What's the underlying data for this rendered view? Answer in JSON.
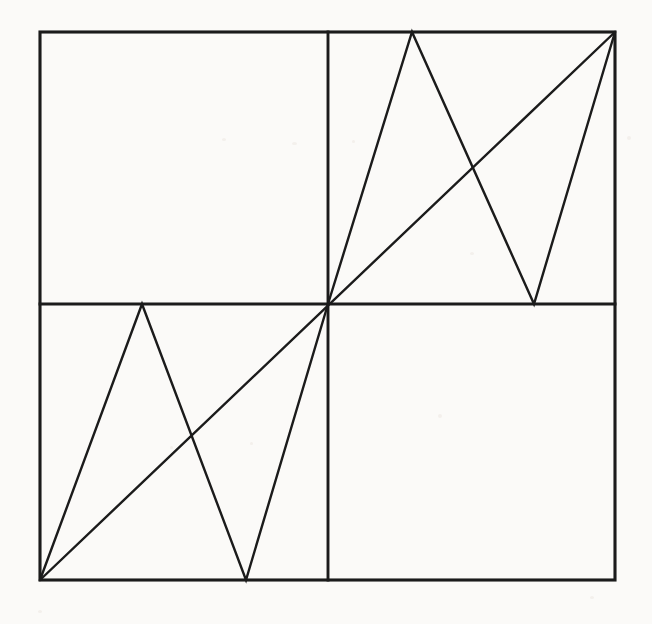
{
  "figure": {
    "background_color": "#fbfaf8",
    "ink_color": "#1b1b1b",
    "canvas": {
      "width": 652,
      "height": 624
    },
    "square": {
      "left": 40,
      "top": 32,
      "right": 615,
      "bottom": 580,
      "width": 575,
      "height": 548
    },
    "center": {
      "x": 328,
      "y": 304
    },
    "dividers": {
      "vertical_x": 328,
      "horizontal_y": 304
    },
    "diagonal": {
      "label": "main-diagonal",
      "from": {
        "x": 40,
        "y": 580
      },
      "to": {
        "x": 615,
        "y": 32
      }
    },
    "zigzag_bottom_left": {
      "label": "sawtooth-bottom-left-quadrant",
      "points": [
        {
          "x": 40,
          "y": 580
        },
        {
          "x": 142,
          "y": 304
        },
        {
          "x": 246,
          "y": 580
        },
        {
          "x": 328,
          "y": 304
        }
      ]
    },
    "zigzag_top_right": {
      "label": "sawtooth-top-right-quadrant",
      "points": [
        {
          "x": 328,
          "y": 304
        },
        {
          "x": 412,
          "y": 32
        },
        {
          "x": 534,
          "y": 304
        },
        {
          "x": 615,
          "y": 32
        }
      ]
    },
    "quadrants": [
      {
        "name": "top-left",
        "content": "empty"
      },
      {
        "name": "top-right",
        "content": "sawtooth-and-diagonal"
      },
      {
        "name": "bottom-left",
        "content": "sawtooth-and-diagonal"
      },
      {
        "name": "bottom-right",
        "content": "empty"
      }
    ]
  },
  "chart_data": {
    "type": "line",
    "xlabel": "",
    "ylabel": "",
    "xlim": [
      0,
      1
    ],
    "ylim": [
      0,
      1
    ],
    "grid": false,
    "legend": "none",
    "series": [
      {
        "name": "identity-diagonal",
        "x": [
          0,
          1
        ],
        "y": [
          0,
          1
        ]
      },
      {
        "name": "sawtooth-lower-left",
        "x": [
          0,
          0.177,
          0.358,
          0.5
        ],
        "y": [
          0,
          0.504,
          0,
          0.504
        ]
      },
      {
        "name": "sawtooth-upper-right",
        "x": [
          0.5,
          0.647,
          0.858,
          1
        ],
        "y": [
          0.496,
          1,
          0.496,
          1
        ]
      }
    ],
    "annotations": [
      {
        "name": "vertical-midline",
        "x": 0.5
      },
      {
        "name": "horizontal-midline",
        "y": 0.5
      }
    ]
  }
}
